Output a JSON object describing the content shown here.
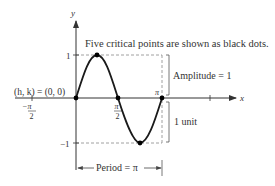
{
  "diagram": {
    "caption": "Five critical points are shown as black dots.",
    "axes": {
      "x_label": "x",
      "y_label": "y",
      "y_tick_top": "1",
      "y_tick_bottom": "−1",
      "x_tick_neg_half_pi_num": "−π",
      "x_tick_neg_half_pi_den": "2",
      "x_tick_half_pi_num": "π",
      "x_tick_half_pi_den": "2",
      "x_tick_pi": "π"
    },
    "annotations": {
      "shift": "(h, k) = (0, 0)",
      "amplitude": "Amplitude = 1",
      "unit": "1 unit",
      "period": "Period = π"
    },
    "function": "y = sin(2x)",
    "critical_points": [
      {
        "x": "0",
        "y": "0"
      },
      {
        "x": "π/4",
        "y": "1"
      },
      {
        "x": "π/2",
        "y": "0"
      },
      {
        "x": "3π/4",
        "y": "−1"
      },
      {
        "x": "π",
        "y": "0"
      }
    ],
    "colors": {
      "curve": "#1a1a1a",
      "axis": "#333333",
      "dashed": "#888888",
      "text": "#333333",
      "dot": "#000000"
    }
  }
}
